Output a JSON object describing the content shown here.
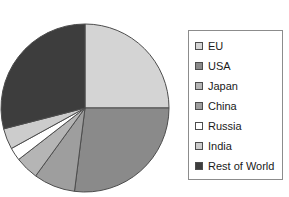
{
  "chart_data": {
    "type": "pie",
    "title": "",
    "legend_position": "right",
    "start_angle_deg": 0,
    "direction": "clockwise",
    "categories": [
      "EU",
      "USA",
      "Japan",
      "China",
      "Russia",
      "India",
      "Rest of World"
    ],
    "values": [
      25,
      27,
      4.5,
      8,
      2.5,
      4,
      29
    ],
    "unit": "percent",
    "slices": [
      {
        "label": "EU",
        "value": 25,
        "color": "#d4d4d4",
        "start_deg": 0,
        "end_deg": 90
      },
      {
        "label": "USA",
        "value": 27,
        "color": "#8a8a8a",
        "start_deg": 90,
        "end_deg": 187.2
      },
      {
        "label": "China",
        "value": 8,
        "color": "#9e9e9e",
        "start_deg": 187.2,
        "end_deg": 216
      },
      {
        "label": "Japan",
        "value": 4.5,
        "color": "#b5b5b5",
        "start_deg": 216,
        "end_deg": 232.2
      },
      {
        "label": "Russia",
        "value": 2.5,
        "color": "#ffffff",
        "start_deg": 232.2,
        "end_deg": 241.2
      },
      {
        "label": "India",
        "value": 4,
        "color": "#cccccc",
        "start_deg": 241.2,
        "end_deg": 255.6
      },
      {
        "label": "Rest of World",
        "value": 29,
        "color": "#3d3d3d",
        "start_deg": 255.6,
        "end_deg": 360
      }
    ]
  },
  "legend": {
    "items": [
      {
        "label": "EU",
        "color": "#d4d4d4"
      },
      {
        "label": "USA",
        "color": "#8a8a8a"
      },
      {
        "label": "Japan",
        "color": "#b5b5b5"
      },
      {
        "label": "China",
        "color": "#9e9e9e"
      },
      {
        "label": "Russia",
        "color": "#ffffff"
      },
      {
        "label": "India",
        "color": "#cccccc"
      },
      {
        "label": "Rest of World",
        "color": "#3d3d3d"
      }
    ]
  },
  "style": {
    "background": "#ffffff",
    "slice_outline": "#4d4d4d",
    "legend_border": "#8c8c8c",
    "text_color": "#1a1a1a"
  }
}
